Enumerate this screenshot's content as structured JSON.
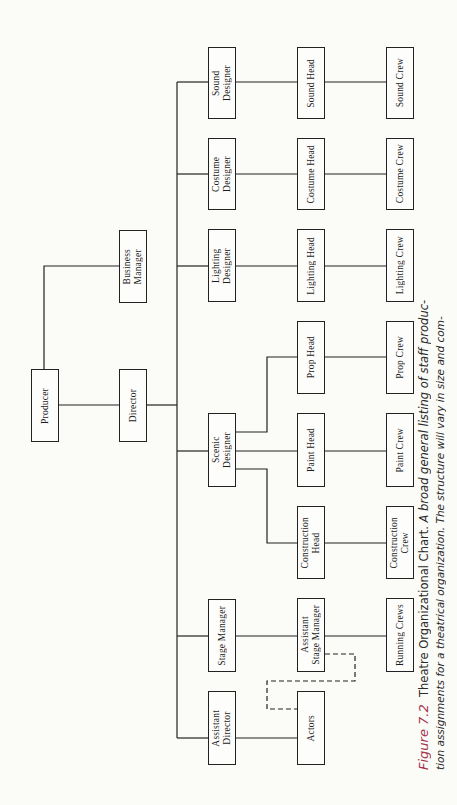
{
  "nodes": {
    "producer": {
      "label": "Producer"
    },
    "business_manager": {
      "label": "Business\nManager"
    },
    "director": {
      "label": "Director"
    },
    "sound_designer": {
      "label": "Sound\nDesigner"
    },
    "costume_designer": {
      "label": "Costume\nDesigner"
    },
    "lighting_designer": {
      "label": "Lighting\nDesigner"
    },
    "scenic_designer": {
      "label": "Scenic\nDesigner"
    },
    "stage_manager": {
      "label": "Stage Manager"
    },
    "assistant_director": {
      "label": "Assistant\nDirector"
    },
    "sound_head": {
      "label": "Sound Head"
    },
    "costume_head": {
      "label": "Costume Head"
    },
    "lighting_head": {
      "label": "Lighting Head"
    },
    "prop_head": {
      "label": "Prop Head"
    },
    "paint_head": {
      "label": "Paint Head"
    },
    "construction_head": {
      "label": "Construction\nHead"
    },
    "assistant_stage_manager": {
      "label": "Assistant\nStage Manager"
    },
    "actors": {
      "label": "Actors"
    },
    "sound_crew": {
      "label": "Sound Crew"
    },
    "costume_crew": {
      "label": "Costume Crew"
    },
    "lighting_crew": {
      "label": "Lighting Crew"
    },
    "prop_crew": {
      "label": "Prop Crew"
    },
    "paint_crew": {
      "label": "Paint Crew"
    },
    "construction_crew": {
      "label": "Construction\nCrew"
    },
    "running_crews": {
      "label": "Running Crews"
    }
  },
  "edges": [
    {
      "from": "producer",
      "to": "business_manager",
      "style": "solid"
    },
    {
      "from": "producer",
      "to": "director",
      "style": "solid"
    },
    {
      "from": "director",
      "to": "sound_designer",
      "style": "solid"
    },
    {
      "from": "director",
      "to": "costume_designer",
      "style": "solid"
    },
    {
      "from": "director",
      "to": "lighting_designer",
      "style": "solid"
    },
    {
      "from": "director",
      "to": "scenic_designer",
      "style": "solid"
    },
    {
      "from": "director",
      "to": "stage_manager",
      "style": "solid"
    },
    {
      "from": "director",
      "to": "assistant_director",
      "style": "solid"
    },
    {
      "from": "sound_designer",
      "to": "sound_head",
      "style": "solid"
    },
    {
      "from": "costume_designer",
      "to": "costume_head",
      "style": "solid"
    },
    {
      "from": "lighting_designer",
      "to": "lighting_head",
      "style": "solid"
    },
    {
      "from": "scenic_designer",
      "to": "prop_head",
      "style": "solid"
    },
    {
      "from": "scenic_designer",
      "to": "paint_head",
      "style": "solid"
    },
    {
      "from": "scenic_designer",
      "to": "construction_head",
      "style": "solid"
    },
    {
      "from": "stage_manager",
      "to": "assistant_stage_manager",
      "style": "solid"
    },
    {
      "from": "assistant_director",
      "to": "actors",
      "style": "solid"
    },
    {
      "from": "assistant_stage_manager",
      "to": "actors",
      "style": "dashed"
    },
    {
      "from": "sound_head",
      "to": "sound_crew",
      "style": "solid"
    },
    {
      "from": "costume_head",
      "to": "costume_crew",
      "style": "solid"
    },
    {
      "from": "lighting_head",
      "to": "lighting_crew",
      "style": "solid"
    },
    {
      "from": "prop_head",
      "to": "prop_crew",
      "style": "solid"
    },
    {
      "from": "paint_head",
      "to": "paint_crew",
      "style": "solid"
    },
    {
      "from": "construction_head",
      "to": "construction_crew",
      "style": "solid"
    },
    {
      "from": "assistant_stage_manager",
      "to": "running_crews",
      "style": "solid"
    }
  ],
  "caption": {
    "figure_label": "Figure 7.2",
    "title": "Theatre Organizational Chart.",
    "line1_rest": "A broad general listing of staff produc-",
    "line2": "tion assignments for a theatrical organization. The structure will vary in size and com-"
  },
  "colors": {
    "figure_label": "#a3324a",
    "lines": "#222222",
    "background": "#fbfbf7"
  }
}
